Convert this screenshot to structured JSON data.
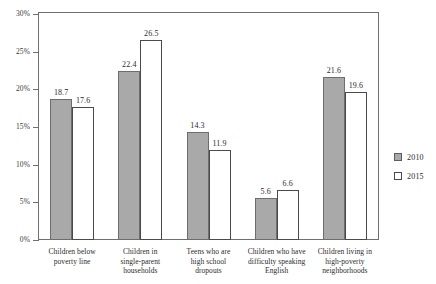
{
  "chart_data": {
    "type": "bar",
    "title": "",
    "subtitle": "",
    "xlabel": "",
    "ylabel": "",
    "ylim": [
      0,
      30
    ],
    "y_tick_labels": [
      "0%",
      "5%",
      "10%",
      "15%",
      "20%",
      "25%",
      "30%"
    ],
    "y_tick_values": [
      0,
      5,
      10,
      15,
      20,
      25,
      30
    ],
    "grid": false,
    "legend_position": "right",
    "categories": [
      "Children below\npoverty line",
      "Children in\nsingle-parent\nhouseholds",
      "Teens who are\nhigh school\ndropouts",
      "Children who have\ndifficulty speaking\nEnglish",
      "Children living in\nhigh-poverty\nneighborhoods"
    ],
    "series": [
      {
        "name": "2010",
        "values": [
          18.7,
          22.4,
          14.3,
          5.6,
          21.6
        ],
        "color": "#a9a9a9"
      },
      {
        "name": "2015",
        "values": [
          17.6,
          26.5,
          11.9,
          6.6,
          19.6
        ],
        "color": "#ffffff"
      }
    ]
  },
  "legend": {
    "items": [
      {
        "label": "2010",
        "swatch": "filled-gray-square"
      },
      {
        "label": "2015",
        "swatch": "hollow-white-square"
      }
    ]
  }
}
